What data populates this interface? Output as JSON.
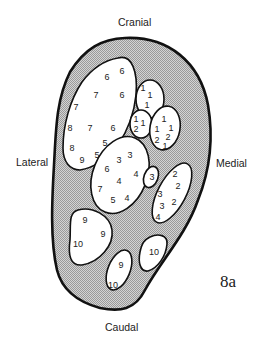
{
  "figure_label": "8a",
  "orientation": {
    "top": "Cranial",
    "bottom": "Caudal",
    "left": "Lateral",
    "right": "Medial"
  },
  "colors": {
    "outline": "#111111",
    "shaded_region": "#c8c8c8",
    "region_fill": "#ffffff"
  },
  "regions": [
    {
      "id": "large-lateral",
      "numbers": [
        "6",
        "6",
        "7",
        "6",
        "7",
        "8",
        "7",
        "6",
        "5",
        "8",
        "9",
        "5"
      ]
    },
    {
      "id": "upper-medial-small",
      "numbers": [
        "1",
        "1",
        "1"
      ]
    },
    {
      "id": "mid-small",
      "numbers": [
        "1",
        "1",
        "2"
      ]
    },
    {
      "id": "medial-oval",
      "numbers": [
        "1",
        "1",
        "1",
        "2",
        "2",
        "1"
      ]
    },
    {
      "id": "central",
      "numbers": [
        "3",
        "3",
        "6",
        "4",
        "4",
        "7",
        "5",
        "4"
      ]
    },
    {
      "id": "tiny-3",
      "numbers": [
        "3"
      ]
    },
    {
      "id": "medial-elongated",
      "numbers": [
        "2",
        "2",
        "3",
        "2",
        "3",
        "4"
      ]
    },
    {
      "id": "lower-lateral",
      "numbers": [
        "9",
        "9",
        "10"
      ]
    },
    {
      "id": "lower-center",
      "numbers": [
        "9",
        "10"
      ]
    },
    {
      "id": "lower-medial",
      "numbers": [
        "10"
      ]
    }
  ]
}
